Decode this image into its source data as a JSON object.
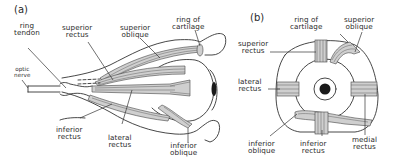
{
  "figure": {
    "panels": [
      {
        "id": "a",
        "tag": "(a)",
        "view": "side view of eyeball with muscles",
        "labels": {
          "ring_tendon": "ring\ntendon",
          "superior_rectus": "superior\nrectus",
          "superior_oblique": "superior\noblique",
          "ring_of_cartilage": "ring of\ncartilage",
          "optic_nerve": "optic\nnerve",
          "inferior_rectus": "inferior\nrectus",
          "lateral_rectus": "lateral\nrectus",
          "inferior_oblique": "inferior\noblique"
        }
      },
      {
        "id": "b",
        "tag": "(b)",
        "view": "front view of eyeball with muscles",
        "labels": {
          "ring_of_cartilage": "ring of\ncartilage",
          "superior_oblique": "superior\noblique",
          "superior_rectus": "superior\nrectus",
          "lateral_rectus": "lateral\nrectus",
          "inferior_oblique": "inferior\noblique",
          "inferior_rectus": "inferior\nrectus",
          "medial_rectus": "medial\nrectus"
        }
      }
    ],
    "colors": {
      "line": "#333333",
      "muscle_fill": "#cfcfcf",
      "pupil": "#1a1a1a",
      "background": "#ffffff"
    }
  }
}
